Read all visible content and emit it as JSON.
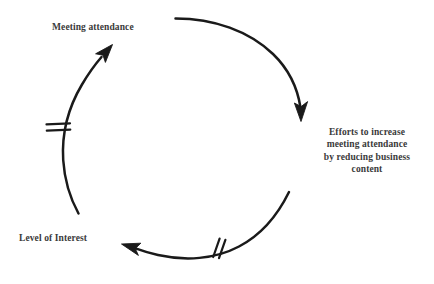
{
  "diagram": {
    "type": "causal-loop-diagram",
    "background_color": "#ffffff",
    "stroke_color": "#1a1a1a",
    "text_color": "#3a3a3a",
    "nodes": [
      {
        "id": "meeting-attendance",
        "label": "Meeting attendance",
        "position": "top-left",
        "align": "left"
      },
      {
        "id": "efforts-to-increase",
        "label": "Efforts to increase\nmeeting attendance\nby reducing business\ncontent",
        "position": "right",
        "align": "center",
        "lines": [
          "Efforts to increase",
          "meeting attendance",
          "by reducing business",
          "content"
        ]
      },
      {
        "id": "level-of-interest",
        "label": "Level of Interest",
        "position": "bottom-left",
        "align": "left"
      }
    ],
    "links": [
      {
        "id": "link-attendance-to-efforts",
        "from": "meeting-attendance",
        "to": "efforts-to-increase",
        "shape": "arc-clockwise-top-right",
        "arrowhead": "down",
        "delay_marks": 0
      },
      {
        "id": "link-efforts-to-interest",
        "from": "efforts-to-increase",
        "to": "level-of-interest",
        "shape": "arc-clockwise-bottom",
        "arrowhead": "left",
        "delay_marks": 2
      },
      {
        "id": "link-interest-to-attendance",
        "from": "level-of-interest",
        "to": "meeting-attendance",
        "shape": "arc-clockwise-left",
        "arrowhead": "up-right",
        "delay_marks": 2
      }
    ]
  }
}
